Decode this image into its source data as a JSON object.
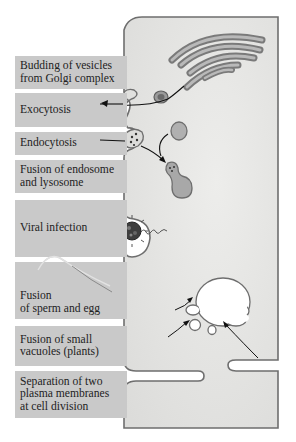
{
  "diagram": {
    "labels": [
      {
        "id": "budding",
        "text": "Budding of vesicles\nfrom Golgi complex",
        "top": 56,
        "height": 33
      },
      {
        "id": "exocytosis",
        "text": "Exocytosis",
        "top": 93,
        "height": 34
      },
      {
        "id": "endocytosis",
        "text": "Endocytosis",
        "top": 132,
        "height": 23
      },
      {
        "id": "endosome-lysosome",
        "text": "Fusion of endosome\nand lysosome",
        "top": 160,
        "height": 33
      },
      {
        "id": "viral-infection",
        "text": "Viral infection",
        "top": 200,
        "height": 57
      },
      {
        "id": "sperm-egg",
        "text": "Fusion\nof sperm and egg",
        "top": 262,
        "height": 57
      },
      {
        "id": "small-vacuoles",
        "text": "Fusion of small\nvacuoles (plants)",
        "top": 326,
        "height": 40
      },
      {
        "id": "cell-division",
        "text": "Separation of two\nplasma membranes\nat cell division",
        "top": 371,
        "height": 47
      }
    ],
    "structures": [
      "Golgi complex",
      "vesicle",
      "endosome",
      "lysosome",
      "virus",
      "sperm",
      "vacuole",
      "plasma membrane"
    ]
  },
  "colors": {
    "label_bg": "#c9c9c9",
    "cytoplasm": "#e4e4e2",
    "membrane": "#6e6e6e",
    "organelle": "#a9a9a9",
    "vacuole": "#ffffff"
  }
}
